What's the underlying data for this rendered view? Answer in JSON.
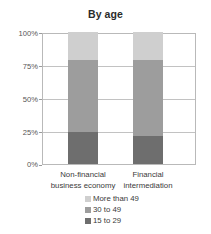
{
  "chart_data": {
    "type": "bar",
    "subtype": "stacked-percentage",
    "title": "By age",
    "xlabel": "",
    "ylabel": "",
    "ylim": [
      0,
      100
    ],
    "yticks": [
      "0%",
      "25%",
      "50%",
      "75%",
      "100%"
    ],
    "ytick_values": [
      0,
      25,
      50,
      75,
      100
    ],
    "grid": true,
    "legend_position": "bottom",
    "categories": [
      "Non-financial business economy",
      "Financial intermediation"
    ],
    "category_lines": [
      [
        "Non-financial",
        "business economy"
      ],
      [
        "Financial",
        "intermediation"
      ]
    ],
    "series": [
      {
        "name": "15 to 29",
        "values": [
          24,
          21
        ],
        "color": "#6e6e6e"
      },
      {
        "name": "30 to 49",
        "values": [
          55,
          58
        ],
        "color": "#9d9d9d"
      },
      {
        "name": "More than 49",
        "values": [
          21,
          21
        ],
        "color": "#cfcfcf"
      }
    ],
    "legend_order": [
      "More than 49",
      "30 to 49",
      "15 to 29"
    ],
    "stack_boundaries_percent": {
      "Non-financial business economy": [
        24,
        79,
        100
      ],
      "Financial intermediation": [
        21,
        79,
        100
      ]
    }
  },
  "colors": {
    "light_gray": "#cfcfcf",
    "medium_gray": "#9d9d9d",
    "dark_gray": "#6e6e6e",
    "grid": "#c2c2c2",
    "axis_text": "#555555",
    "label_text": "#3a3a3a",
    "title_text": "#2b2b2b",
    "background": "#ffffff"
  }
}
